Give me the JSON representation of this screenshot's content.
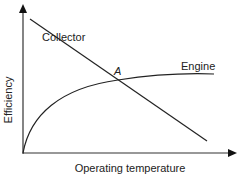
{
  "diagram": {
    "x_axis_label": "Operating temperature",
    "y_axis_label": "Efficiency",
    "curves": [
      {
        "name": "Collector",
        "shape": "straight line decreasing"
      },
      {
        "name": "Engine",
        "shape": "concave increasing, saturating"
      }
    ],
    "intersection_label": "A",
    "line_color": "#222222",
    "background": "#ffffff"
  }
}
